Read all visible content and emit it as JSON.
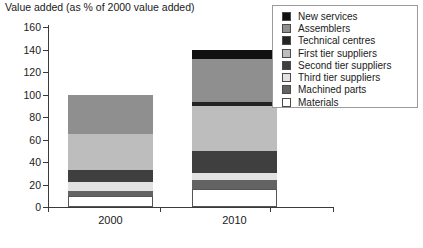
{
  "chart_data": {
    "type": "bar",
    "subtype": "stacked-bar",
    "title": "Value added (as % of 2000 value added)",
    "xlabel": "",
    "ylabel": "",
    "ylim": [
      0,
      160
    ],
    "ytick_labels": [
      "0",
      "20",
      "40",
      "60",
      "80",
      "100",
      "120",
      "140",
      "160"
    ],
    "ytick_values": [
      0,
      20,
      40,
      60,
      80,
      100,
      120,
      140,
      160
    ],
    "grid": false,
    "legend_position": "top-right",
    "categories": [
      "2000",
      "2010"
    ],
    "stack_order_bottom_to_top": [
      "Materials",
      "Machined parts",
      "Third tier suppliers",
      "Second tier suppliers",
      "First tier suppliers",
      "Technical centres",
      "Assemblers",
      "New services"
    ],
    "series": [
      {
        "name": "New services",
        "color": "#111111",
        "values": [
          0,
          8
        ]
      },
      {
        "name": "Assemblers",
        "color": "#8f8f8f",
        "values": [
          35,
          39
        ]
      },
      {
        "name": "Technical centres",
        "color": "#242424",
        "values": [
          0,
          3
        ]
      },
      {
        "name": "First tier suppliers",
        "color": "#bdbdbd",
        "values": [
          32,
          40
        ]
      },
      {
        "name": "Second tier suppliers",
        "color": "#3f3f3f",
        "values": [
          11,
          20
        ]
      },
      {
        "name": "Third tier suppliers",
        "color": "#e2e2e2",
        "values": [
          8,
          6
        ]
      },
      {
        "name": "Machined parts",
        "color": "#636363",
        "values": [
          4,
          8
        ]
      },
      {
        "name": "Materials",
        "color": "#ffffff",
        "values": [
          10,
          16
        ]
      }
    ],
    "totals": [
      100,
      140
    ],
    "stacked_tops": {
      "2000": [
        10,
        14,
        22,
        33,
        65,
        65,
        100,
        100
      ],
      "2010": [
        16,
        24,
        30,
        50,
        90,
        93,
        132,
        140
      ]
    }
  },
  "legend": {
    "entries": [
      {
        "label": "New services",
        "swatch": "#111111"
      },
      {
        "label": "Assemblers",
        "swatch": "#8f8f8f"
      },
      {
        "label": "Technical centres",
        "swatch": "#242424"
      },
      {
        "label": "First tier suppliers",
        "swatch": "#bdbdbd"
      },
      {
        "label": "Second tier suppliers",
        "swatch": "#3f3f3f"
      },
      {
        "label": "Third tier suppliers",
        "swatch": "#e2e2e2"
      },
      {
        "label": "Machined parts",
        "swatch": "#636363"
      },
      {
        "label": "Materials",
        "swatch": "#ffffff"
      }
    ]
  },
  "axes": {
    "y_ticks": [
      "160",
      "140",
      "120",
      "100",
      "80",
      "60",
      "40",
      "20",
      "0"
    ],
    "x_ticks": [
      "2000",
      "2010"
    ]
  },
  "colors": {
    "axis": "#3a3a3a",
    "text": "#1a1a1a",
    "legend_border": "#9a9a9a",
    "background": "#ffffff",
    "segment_outline": "#555555"
  }
}
